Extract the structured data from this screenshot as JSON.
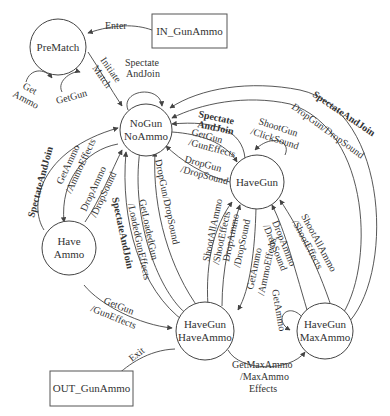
{
  "diagram": {
    "type": "state-machine",
    "states": {
      "prematch": "PreMatch",
      "nogun_noammo_1": "NoGun",
      "nogun_noammo_2": "NoAmmo",
      "havegun": "HaveGun",
      "haveammo_1": "Have",
      "haveammo_2": "Ammo",
      "havegun_haveammo_1": "HaveGun",
      "havegun_haveammo_2": "HaveAmmo",
      "havegun_maxammo_1": "HaveGun",
      "havegun_maxammo_2": "MaxAmmo"
    },
    "boxes": {
      "in": "IN_GunAmmo",
      "out": "OUT_GunAmmo"
    },
    "edges": {
      "enter": "Enter",
      "exit": "Exit",
      "initiate_match_1": "Initiate",
      "initiate_match_2": "Match",
      "prematch_getammo_1": "Get",
      "prematch_getammo_2": "Ammo",
      "prematch_getgun": "GetGun",
      "nogun_spectate_1": "Spectate",
      "nogun_spectate_2": "AndJoin",
      "havegun_spectate_1": "Spectate",
      "havegun_spectate_2": "AndJoin",
      "havegun_getgun_1": "GetGun",
      "havegun_getgun_2": "/GunEffects",
      "havegun_shootgun_1": "ShootGun",
      "havegun_shootgun_2": "/ClickSound",
      "havegun_dropgun_1": "DropGun",
      "havegun_dropgun_2": "/DropSound",
      "outer_spectate": "SpectateAndJoin",
      "outer_dropgun": "DropGun/DropSound",
      "haveammo_spectate": "SpectateAndJoin",
      "haveammo_getammo_1": "GetAmmo",
      "haveammo_getammo_2": "/AmmoEffects",
      "haveammo_dropammo_1": "DropAmmo",
      "haveammo_dropammo_2": "/DropSound",
      "hgha_spectate": "SpectateAndJoin",
      "hgha_getloaded_1": "GetLoadedGun",
      "hgha_getloaded_2": "/LoadedGunEffects",
      "hgha_dropgun": "DropGun/DropSound",
      "hgha_shootall_1": "ShootAllAmmo",
      "hgha_shootall_2": "/ShootEffects",
      "hgha_dropammo_1": "DropAmmo",
      "hgha_dropammo_2": "/DropSound",
      "hgha_getammo_1": "GetAmmo",
      "hgha_getammo_2": "/AmmoEffects",
      "hgma_dropammo_1": "DropAmmo",
      "hgma_dropammo_2": "/DropSound",
      "hgma_shootall_1": "ShootAllAmmo",
      "hgma_shootall_2": "/ShootEffects",
      "haveammo_getgun_1": "GetGun",
      "haveammo_getgun_2": "/GunEffects",
      "getmaxammo_1": "GetMaxAmmo",
      "getmaxammo_2": "/MaxAmmo",
      "getmaxammo_3": "Effects",
      "hgma_getammo": "GetAmmo"
    }
  }
}
